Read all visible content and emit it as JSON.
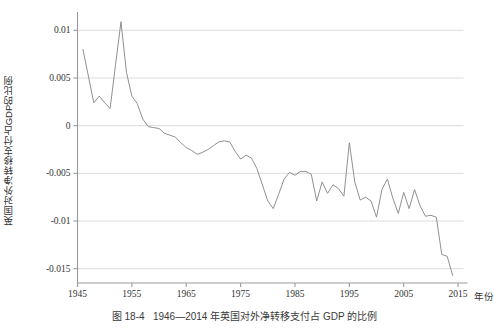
{
  "figure": {
    "caption": "图 18-4   1946—2014 年英国对外净转移支付占 GDP 的比例",
    "page_bleed_text": "",
    "line_color": "#8a8a8a",
    "grid_color": "#d8d8d8",
    "axis_color": "#9a9a9a",
    "background": "#ffffff"
  },
  "axes": {
    "y_title": "英国对外净转移支付占GDP的比例",
    "x_title": "年份",
    "y_ticks": [
      "0.01",
      "0.005",
      "0",
      "-0.005",
      "-0.01",
      "-0.015"
    ],
    "y_tick_values": [
      0.01,
      0.005,
      0,
      -0.005,
      -0.01,
      -0.015
    ],
    "x_ticks": [
      "1945",
      "1955",
      "1965",
      "1975",
      "1985",
      "1995",
      "2005",
      "2015"
    ],
    "x_tick_values": [
      1945,
      1955,
      1965,
      1975,
      1985,
      1995,
      2005,
      2015
    ]
  },
  "chart_data": {
    "type": "line",
    "xlabel": "年份",
    "ylabel": "英国对外净转移支付占GDP的比例",
    "xlim": [
      1945,
      2016
    ],
    "ylim": [
      -0.0165,
      0.0115
    ],
    "grid": true,
    "grid_axis": "y",
    "legend": false,
    "series": [
      {
        "name": "英国对外净转移支付占GDP的比例",
        "color": "#8a8a8a",
        "x": [
          1946,
          1947,
          1948,
          1949,
          1950,
          1951,
          1952,
          1953,
          1954,
          1955,
          1956,
          1957,
          1958,
          1959,
          1960,
          1961,
          1962,
          1963,
          1964,
          1965,
          1966,
          1967,
          1968,
          1969,
          1970,
          1971,
          1972,
          1973,
          1974,
          1975,
          1976,
          1977,
          1978,
          1979,
          1980,
          1981,
          1982,
          1983,
          1984,
          1985,
          1986,
          1987,
          1988,
          1989,
          1990,
          1991,
          1992,
          1993,
          1994,
          1995,
          1996,
          1997,
          1998,
          1999,
          2000,
          2001,
          2002,
          2003,
          2004,
          2005,
          2006,
          2007,
          2008,
          2009,
          2010,
          2011,
          2012,
          2013,
          2014
        ],
        "values": [
          0.008,
          0.0052,
          0.0024,
          0.0031,
          0.0024,
          0.0018,
          0.0064,
          0.0109,
          0.0056,
          0.0031,
          0.0023,
          0.0007,
          -0.0001,
          -0.0002,
          -0.0003,
          -0.0008,
          -0.001,
          -0.0012,
          -0.0018,
          -0.0023,
          -0.0026,
          -0.003,
          -0.0028,
          -0.0025,
          -0.0021,
          -0.0017,
          -0.0016,
          -0.0017,
          -0.0027,
          -0.0035,
          -0.0031,
          -0.0034,
          -0.0045,
          -0.0062,
          -0.0079,
          -0.0087,
          -0.0072,
          -0.0056,
          -0.0049,
          -0.0052,
          -0.0048,
          -0.0048,
          -0.0051,
          -0.0079,
          -0.0059,
          -0.0071,
          -0.0062,
          -0.0066,
          -0.0074,
          -0.0018,
          -0.0059,
          -0.0078,
          -0.0075,
          -0.0079,
          -0.0096,
          -0.0067,
          -0.0056,
          -0.0076,
          -0.0092,
          -0.007,
          -0.0087,
          -0.0067,
          -0.0084,
          -0.0095,
          -0.0094,
          -0.0096,
          -0.0135,
          -0.0137,
          -0.0157
        ]
      }
    ]
  }
}
